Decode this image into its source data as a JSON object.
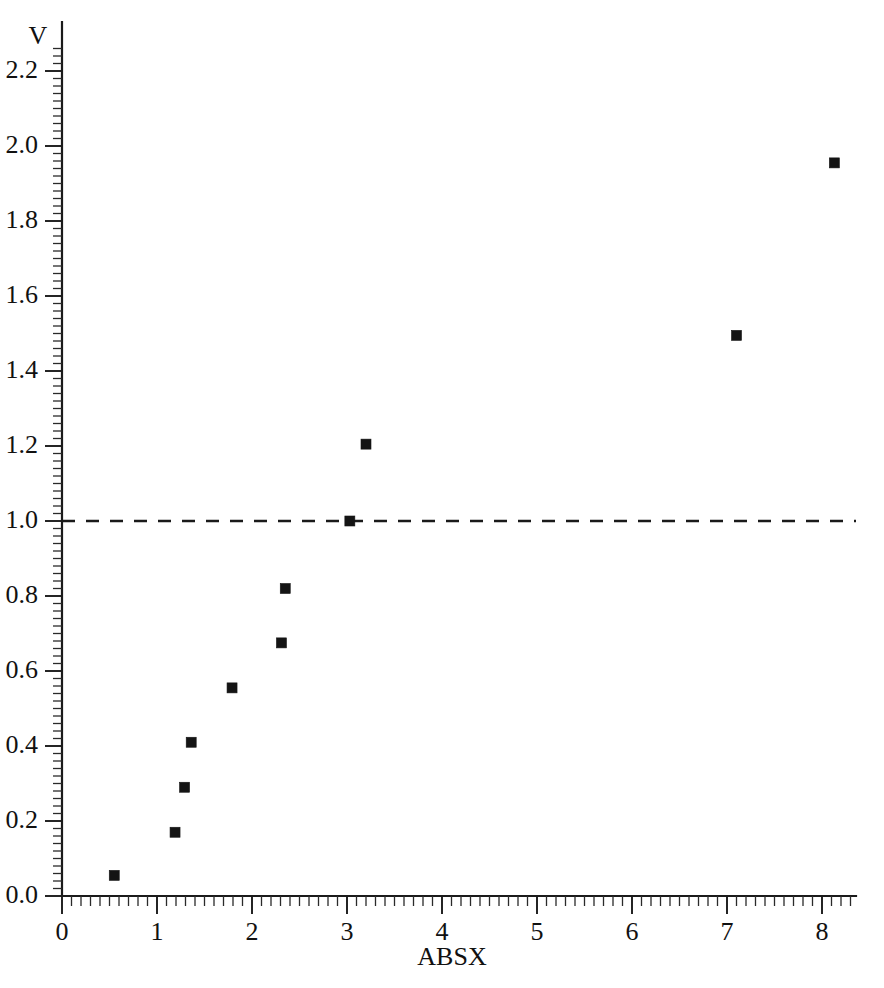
{
  "chart_data": {
    "type": "scatter",
    "title": "",
    "xlabel": "ABSX",
    "ylabel": "V",
    "xlim": [
      0,
      8.4
    ],
    "ylim": [
      0,
      2.28
    ],
    "grid": false,
    "legend": null,
    "x": [
      0.55,
      1.19,
      1.29,
      1.36,
      1.79,
      2.31,
      2.35,
      3.03,
      3.2,
      7.1,
      8.13
    ],
    "y": [
      0.055,
      0.17,
      0.29,
      0.41,
      0.555,
      0.675,
      0.82,
      1.0,
      1.205,
      1.495,
      1.955
    ],
    "points": [
      {
        "x": 0.55,
        "y": 0.055
      },
      {
        "x": 1.19,
        "y": 0.17
      },
      {
        "x": 1.29,
        "y": 0.29
      },
      {
        "x": 1.36,
        "y": 0.41
      },
      {
        "x": 1.79,
        "y": 0.555
      },
      {
        "x": 2.31,
        "y": 0.675
      },
      {
        "x": 2.35,
        "y": 0.82
      },
      {
        "x": 3.03,
        "y": 1.0
      },
      {
        "x": 3.2,
        "y": 1.205
      },
      {
        "x": 7.1,
        "y": 1.495
      },
      {
        "x": 8.13,
        "y": 1.955
      }
    ],
    "marker": {
      "shape": "square",
      "color": "#141414",
      "size_px": 10
    },
    "reference_lines": [
      {
        "orientation": "horizontal",
        "value": 1.0,
        "style": "dashed",
        "color": "#1a1a1a"
      }
    ],
    "xticks": [
      0,
      1,
      2,
      3,
      4,
      5,
      6,
      7,
      8
    ],
    "xticklabels": [
      "0",
      "1",
      "2",
      "3",
      "4",
      "5",
      "6",
      "7",
      "8"
    ],
    "yticks": [
      0.0,
      0.2,
      0.4,
      0.6,
      0.8,
      1.0,
      1.2,
      1.4,
      1.6,
      1.8,
      2.0,
      2.2
    ],
    "yticklabels": [
      "0.0",
      "0.2",
      "0.4",
      "0.6",
      "0.8",
      "1.0",
      "1.2",
      "1.4",
      "1.6",
      "1.8",
      "2.0",
      "2.2"
    ],
    "x_minor_interval": 0.1,
    "y_minor_interval": 0.02
  }
}
